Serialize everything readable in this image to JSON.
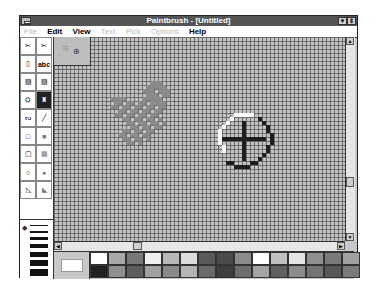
{
  "window": {
    "title": "Paintbrush - [Untitled]",
    "minimize_glyph": "▼",
    "restore_glyph": "⇕"
  },
  "menu": [
    {
      "label": "File",
      "enabled": false
    },
    {
      "label": "Edit",
      "enabled": true
    },
    {
      "label": "View",
      "enabled": true
    },
    {
      "label": "Text",
      "enabled": false
    },
    {
      "label": "Pick",
      "enabled": false
    },
    {
      "label": "Options",
      "enabled": false
    },
    {
      "label": "Help",
      "enabled": true
    }
  ],
  "toolbox": {
    "tools": [
      {
        "name": "scissors-select",
        "glyph": "✂"
      },
      {
        "name": "pick",
        "glyph": "✂"
      },
      {
        "name": "airbrush",
        "glyph": "▯"
      },
      {
        "name": "text",
        "glyph": "abc"
      },
      {
        "name": "color-eraser",
        "glyph": "▨"
      },
      {
        "name": "eraser",
        "glyph": "▨"
      },
      {
        "name": "paint-roller",
        "glyph": "⛭"
      },
      {
        "name": "brush",
        "glyph": "♜"
      },
      {
        "name": "curve",
        "glyph": "ᔓ"
      },
      {
        "name": "line",
        "glyph": "╱"
      },
      {
        "name": "box",
        "glyph": "□"
      },
      {
        "name": "filled-box",
        "glyph": "■"
      },
      {
        "name": "rounded-box",
        "glyph": "▢"
      },
      {
        "name": "filled-rounded-box",
        "glyph": "▩"
      },
      {
        "name": "circle",
        "glyph": "○"
      },
      {
        "name": "filled-circle",
        "glyph": "●"
      },
      {
        "name": "polygon",
        "glyph": "◺"
      },
      {
        "name": "filled-polygon",
        "glyph": "◣"
      }
    ],
    "selected_tool": "brush",
    "line_widths": [
      1,
      2,
      3,
      4,
      5,
      6,
      7
    ],
    "line_width_pointer": "◆"
  },
  "canvas": {
    "view": "zoomed-in",
    "scroll": {
      "up": "▲",
      "down": "▼",
      "left": "◀",
      "right": "▶"
    }
  },
  "palette": {
    "foreground": "#ffffff",
    "background": "#c8c8c8",
    "colors_top": [
      "#ffffff",
      "#a8a8a8",
      "#787878",
      "#f0f0f0",
      "#b8b8b8",
      "#dcdcdc",
      "#5a5a5a",
      "#4a4a4a",
      "#8c8c8c",
      "#ffffff",
      "#c0c0c0",
      "#e4e4e4",
      "#909090",
      "#7a7a7a",
      "#a0a0a0"
    ],
    "colors_bottom": [
      "#222222",
      "#909090",
      "#5e5e5e",
      "#a0a0a0",
      "#8a8a8a",
      "#b4b4b4",
      "#6a6a6a",
      "#3e3e3e",
      "#6e6e6e",
      "#a4a4a4",
      "#606060",
      "#8c8c8c",
      "#747474",
      "#585858",
      "#7a7a7a"
    ]
  }
}
